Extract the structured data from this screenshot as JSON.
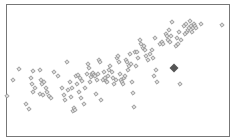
{
  "chart_data": {
    "type": "scatter",
    "title": "",
    "xlabel": "",
    "ylabel": "",
    "grid": false,
    "legend": null,
    "frame": {
      "left": 6,
      "top": 4,
      "right": 229,
      "bottom": 136
    },
    "marker": {
      "shape": "diamond",
      "size": 2.2,
      "stroke": "#8a8a8a",
      "fill": "#d8d8d8"
    },
    "highlight": {
      "x": 174,
      "y": 68,
      "size": 4.5,
      "color": "#555555"
    },
    "points_px": [
      [
        7,
        96
      ],
      [
        13,
        80
      ],
      [
        19,
        69
      ],
      [
        26,
        104
      ],
      [
        29,
        109
      ],
      [
        31,
        78
      ],
      [
        32,
        84
      ],
      [
        33,
        71
      ],
      [
        33,
        92
      ],
      [
        35,
        88
      ],
      [
        40,
        70
      ],
      [
        40,
        94
      ],
      [
        41,
        80
      ],
      [
        42,
        84
      ],
      [
        43,
        95
      ],
      [
        44,
        82
      ],
      [
        46,
        88
      ],
      [
        47,
        92
      ],
      [
        49,
        96
      ],
      [
        51,
        98
      ],
      [
        54,
        72
      ],
      [
        58,
        76
      ],
      [
        62,
        88
      ],
      [
        64,
        95
      ],
      [
        65,
        100
      ],
      [
        67,
        62
      ],
      [
        68,
        90
      ],
      [
        70,
        82
      ],
      [
        71,
        97
      ],
      [
        72,
        88
      ],
      [
        73,
        111
      ],
      [
        74,
        108
      ],
      [
        75,
        110
      ],
      [
        76,
        76
      ],
      [
        77,
        84
      ],
      [
        78,
        75
      ],
      [
        79,
        92
      ],
      [
        80,
        78
      ],
      [
        81,
        98
      ],
      [
        82,
        81
      ],
      [
        84,
        104
      ],
      [
        85,
        88
      ],
      [
        87,
        74
      ],
      [
        88,
        64
      ],
      [
        89,
        68
      ],
      [
        90,
        82
      ],
      [
        91,
        77
      ],
      [
        92,
        74
      ],
      [
        93,
        73
      ],
      [
        94,
        75
      ],
      [
        95,
        76
      ],
      [
        96,
        94
      ],
      [
        97,
        80
      ],
      [
        98,
        74
      ],
      [
        99,
        60
      ],
      [
        100,
        62
      ],
      [
        101,
        100
      ],
      [
        103,
        80
      ],
      [
        104,
        72
      ],
      [
        105,
        78
      ],
      [
        106,
        81
      ],
      [
        107,
        82
      ],
      [
        108,
        76
      ],
      [
        109,
        70
      ],
      [
        110,
        66
      ],
      [
        112,
        72
      ],
      [
        113,
        78
      ],
      [
        114,
        84
      ],
      [
        116,
        80
      ],
      [
        117,
        58
      ],
      [
        118,
        56
      ],
      [
        119,
        62
      ],
      [
        120,
        74
      ],
      [
        121,
        80
      ],
      [
        122,
        82
      ],
      [
        123,
        84
      ],
      [
        124,
        78
      ],
      [
        125,
        76
      ],
      [
        126,
        60
      ],
      [
        127,
        62
      ],
      [
        128,
        70
      ],
      [
        129,
        66
      ],
      [
        130,
        54
      ],
      [
        131,
        64
      ],
      [
        132,
        82
      ],
      [
        133,
        93
      ],
      [
        134,
        107
      ],
      [
        135,
        52
      ],
      [
        136,
        66
      ],
      [
        137,
        52
      ],
      [
        138,
        58
      ],
      [
        140,
        40
      ],
      [
        141,
        44
      ],
      [
        143,
        48
      ],
      [
        144,
        46
      ],
      [
        145,
        50
      ],
      [
        146,
        56
      ],
      [
        148,
        60
      ],
      [
        150,
        54
      ],
      [
        152,
        50
      ],
      [
        153,
        58
      ],
      [
        154,
        76
      ],
      [
        155,
        38
      ],
      [
        156,
        70
      ],
      [
        157,
        82
      ],
      [
        160,
        44
      ],
      [
        162,
        42
      ],
      [
        163,
        44
      ],
      [
        166,
        34
      ],
      [
        167,
        36
      ],
      [
        168,
        40
      ],
      [
        169,
        30
      ],
      [
        170,
        42
      ],
      [
        171,
        36
      ],
      [
        172,
        22
      ],
      [
        176,
        46
      ],
      [
        177,
        38
      ],
      [
        178,
        44
      ],
      [
        179,
        32
      ],
      [
        180,
        84
      ],
      [
        181,
        40
      ],
      [
        184,
        26
      ],
      [
        185,
        34
      ],
      [
        186,
        24
      ],
      [
        187,
        32
      ],
      [
        188,
        30
      ],
      [
        189,
        28
      ],
      [
        190,
        21
      ],
      [
        191,
        26
      ],
      [
        192,
        32
      ],
      [
        193,
        28
      ],
      [
        194,
        24
      ],
      [
        195,
        26
      ],
      [
        196,
        28
      ],
      [
        201,
        24
      ],
      [
        222,
        25
      ]
    ]
  }
}
